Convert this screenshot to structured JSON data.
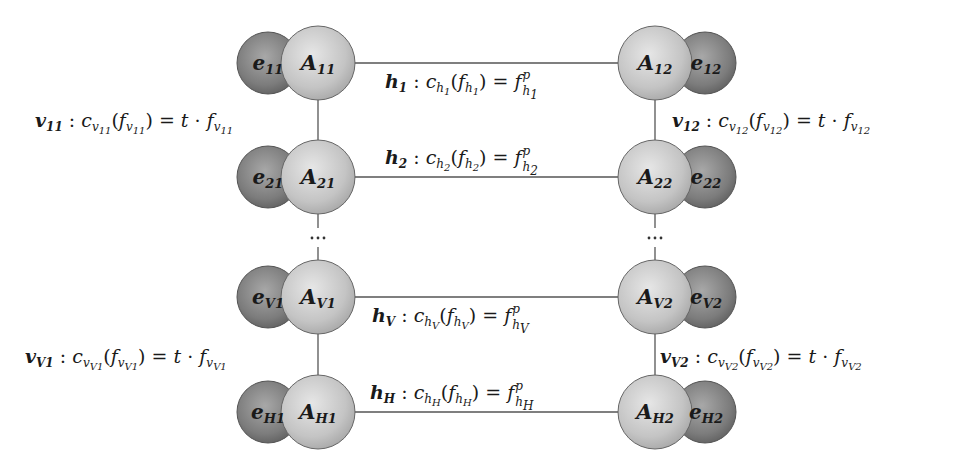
{
  "diagram": {
    "colors": {
      "a_node_fill": "#c8c8c8",
      "e_node_fill": "#8a8a8a",
      "edge": "#555555",
      "text": "#1a1a1a"
    },
    "rows": [
      {
        "id": "1",
        "left": {
          "a_label": "A",
          "a_sub": "11",
          "e_label": "e",
          "e_sub": "11"
        },
        "right": {
          "a_label": "A",
          "a_sub": "12",
          "e_label": "e",
          "e_sub": "12"
        },
        "h_edge": {
          "name": "h",
          "sub": "1",
          "cost": "c",
          "flow": "f",
          "rhs": "f",
          "rhs_sup": "p",
          "label_text": "h1 : c_h1(f_h1) = f^p_h1"
        }
      },
      {
        "id": "2",
        "left": {
          "a_label": "A",
          "a_sub": "21",
          "e_label": "e",
          "e_sub": "21"
        },
        "right": {
          "a_label": "A",
          "a_sub": "22",
          "e_label": "e",
          "e_sub": "22"
        },
        "h_edge": {
          "name": "h",
          "sub": "2",
          "cost": "c",
          "flow": "f",
          "rhs": "f",
          "rhs_sup": "p",
          "label_text": "h2 : c_h2(f_h2) = f^p_h2"
        }
      },
      {
        "id": "V",
        "left": {
          "a_label": "A",
          "a_sub": "V1",
          "e_label": "e",
          "e_sub": "V1"
        },
        "right": {
          "a_label": "A",
          "a_sub": "V2",
          "e_label": "e",
          "e_sub": "V2"
        },
        "h_edge": {
          "name": "h",
          "sub": "V",
          "cost": "c",
          "flow": "f",
          "rhs": "f",
          "rhs_sup": "p",
          "label_text": "hV : c_hV(f_hV) = f^p_hV"
        }
      },
      {
        "id": "H",
        "left": {
          "a_label": "A",
          "a_sub": "H1",
          "e_label": "e",
          "e_sub": "H1"
        },
        "right": {
          "a_label": "A",
          "a_sub": "H2",
          "e_label": "e",
          "e_sub": "H2"
        },
        "h_edge": {
          "name": "h",
          "sub": "H",
          "cost": "c",
          "flow": "f",
          "rhs": "f",
          "rhs_sup": "p",
          "label_text": "hH : c_hH(f_hH) = f^p_hH"
        }
      }
    ],
    "v_edges": [
      {
        "name": "v",
        "sub": "11",
        "t": "t",
        "dot": "·",
        "label_text": "v11 : c_v11(f_v11) = t · f_v11"
      },
      {
        "name": "v",
        "sub": "12",
        "t": "t",
        "dot": "·",
        "label_text": "v12 : c_v12(f_v12) = t · f_v12"
      },
      {
        "name": "v",
        "sub": "V1",
        "t": "t",
        "dot": "·",
        "label_text": "vV1 : c_vV1(f_vV1) = t · f_vV1"
      },
      {
        "name": "v",
        "sub": "V2",
        "t": "t",
        "dot": "·",
        "label_text": "vV2 : c_vV2(f_vV2) = t · f_vV2"
      }
    ],
    "ellipsis": "···",
    "symbols": {
      "colon": ":",
      "equals": "=",
      "lparen": "(",
      "rparen": ")"
    }
  }
}
